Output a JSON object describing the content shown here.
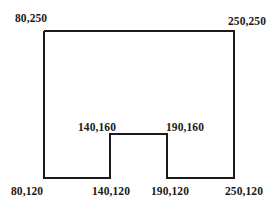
{
  "diagram": {
    "type": "polygon",
    "stroke_color": "#1a1a1a",
    "fill_color": "#ffffff",
    "vertices": [
      {
        "coord": "80,250",
        "x": 44,
        "y": 31
      },
      {
        "coord": "250,250",
        "x": 234,
        "y": 31
      },
      {
        "coord": "250,120",
        "x": 234,
        "y": 178
      },
      {
        "coord": "190,120",
        "x": 167,
        "y": 178
      },
      {
        "coord": "190,160",
        "x": 167,
        "y": 134
      },
      {
        "coord": "140,160",
        "x": 110,
        "y": 134
      },
      {
        "coord": "140,120",
        "x": 110,
        "y": 178
      },
      {
        "coord": "80,120",
        "x": 44,
        "y": 178
      }
    ],
    "labels": {
      "top_left": "80,250",
      "top_right": "250,250",
      "notch_left_top": "140,160",
      "notch_right_top": "190,160",
      "bottom_left": "80,120",
      "notch_left_bottom": "140,120",
      "notch_right_bottom": "190,120",
      "bottom_right": "250,120"
    }
  }
}
